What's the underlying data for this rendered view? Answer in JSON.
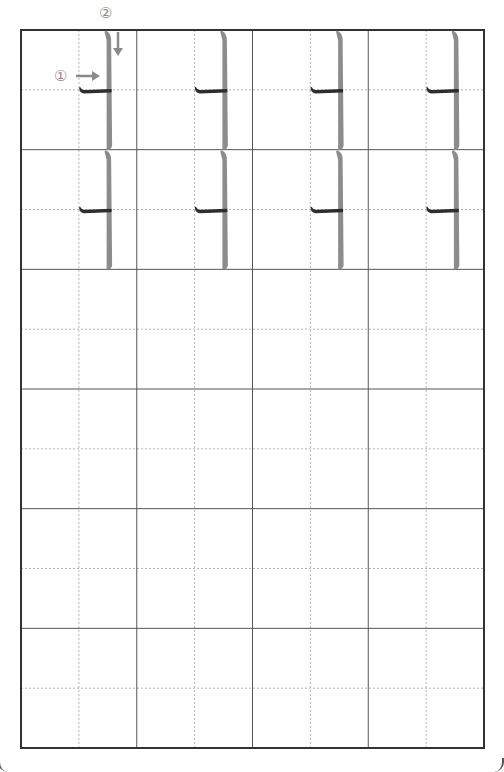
{
  "sheet": {
    "title": "Calligraphy practice grid",
    "grid": {
      "left": 21,
      "top": 30,
      "right": 484,
      "bottom": 748,
      "columns": 4,
      "rows": 6
    },
    "colors": {
      "border": "#333333",
      "cell_line": "#555555",
      "guide_line": "#b5b5b5",
      "stroke_trace": "#8c8c8c",
      "stroke_ink": "#2e2e2e",
      "annotation": "#8a8a8a"
    }
  },
  "annotations": {
    "stroke_1_number": "①",
    "stroke_2_number": "②",
    "stroke_1_direction": "right-arrow",
    "stroke_2_direction": "down-arrow"
  },
  "model_characters": [
    {
      "row": 0,
      "col": 0
    },
    {
      "row": 0,
      "col": 1
    },
    {
      "row": 0,
      "col": 2
    },
    {
      "row": 0,
      "col": 3
    },
    {
      "row": 1,
      "col": 0
    },
    {
      "row": 1,
      "col": 1
    },
    {
      "row": 1,
      "col": 2
    },
    {
      "row": 1,
      "col": 3
    }
  ],
  "empty_rows": 4
}
